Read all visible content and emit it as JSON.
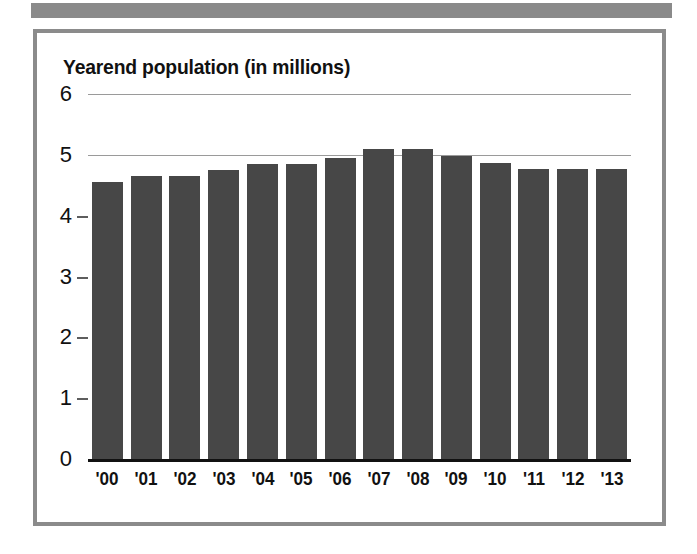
{
  "decor": {
    "top_band_color": "#8a8a8a",
    "frame_border_color": "#8b8b8b"
  },
  "chart_data": {
    "type": "bar",
    "title": "Yearend population (in millions)",
    "xlabel": "",
    "ylabel": "",
    "ylim": [
      0,
      6
    ],
    "yticks": [
      0,
      1,
      2,
      3,
      4,
      5,
      6
    ],
    "ytick_labels": [
      "0",
      "1",
      "2",
      "3",
      "4",
      "5",
      "6"
    ],
    "gridlines_shown_at": [
      5,
      6
    ],
    "grid": true,
    "legend": "none",
    "bar_color": "#474747",
    "categories": [
      "'00",
      "'01",
      "'02",
      "'03",
      "'04",
      "'05",
      "'06",
      "'07",
      "'08",
      "'09",
      "'10",
      "'11",
      "'12",
      "'13"
    ],
    "values": [
      4.55,
      4.65,
      4.65,
      4.75,
      4.85,
      4.85,
      4.95,
      5.1,
      5.1,
      4.98,
      4.87,
      4.77,
      4.77,
      4.77
    ]
  }
}
